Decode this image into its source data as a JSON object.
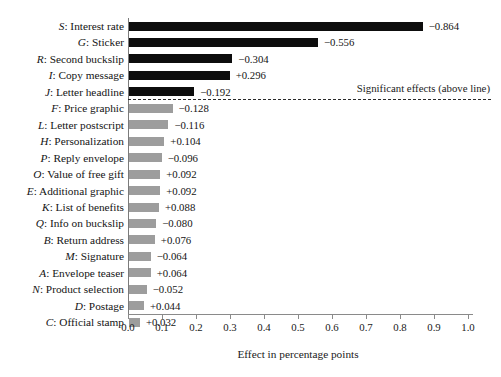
{
  "chart_data": {
    "type": "bar",
    "orientation": "horizontal",
    "title": "",
    "xlabel": "Effect in percentage points",
    "ylabel": "",
    "xlim": [
      0.0,
      1.0
    ],
    "xticks": [
      "0.0",
      "0.1",
      "0.2",
      "0.3",
      "0.4",
      "0.5",
      "0.6",
      "0.7",
      "0.8",
      "0.9",
      "1.0"
    ],
    "xtick_values": [
      0.0,
      0.1,
      0.2,
      0.3,
      0.4,
      0.5,
      0.6,
      0.7,
      0.8,
      0.9,
      1.0
    ],
    "grid": false,
    "legend": null,
    "annotations": [
      {
        "text": "Significant effects (above line)",
        "kind": "divider-note",
        "position": "right-of-dashed-line"
      }
    ],
    "divider": {
      "style": "dashed",
      "after_category_index": 4,
      "meaning": "bars above the line are statistically significant"
    },
    "categories": [
      "S: Interest rate",
      "G: Sticker",
      "R: Second buckslip",
      "I: Copy message",
      "J: Letter headline",
      "F: Price graphic",
      "L: Letter postscript",
      "H: Personalization",
      "P: Reply envelope",
      "O: Value of free gift",
      "E: Additional graphic",
      "K: List of benefits",
      "Q: Info on buckslip",
      "B: Return address",
      "M: Signature",
      "A: Envelope teaser",
      "N: Product selection",
      "D: Postage",
      "C: Official stamp"
    ],
    "values": [
      0.864,
      0.556,
      0.304,
      0.296,
      0.192,
      0.128,
      0.116,
      0.104,
      0.096,
      0.092,
      0.092,
      0.088,
      0.08,
      0.076,
      0.064,
      0.064,
      0.052,
      0.044,
      0.032
    ],
    "signs": [
      "-",
      "-",
      "-",
      "+",
      "-",
      "-",
      "-",
      "+",
      "-",
      "+",
      "+",
      "+",
      "-",
      "+",
      "-",
      "+",
      "-",
      "+",
      "+"
    ],
    "signed_values": [
      -0.864,
      -0.556,
      -0.304,
      0.296,
      -0.192,
      -0.128,
      -0.116,
      0.104,
      -0.096,
      0.092,
      0.092,
      0.088,
      -0.08,
      0.076,
      -0.064,
      0.064,
      -0.052,
      0.044,
      0.032
    ]
  },
  "rows": [
    {
      "code": "S",
      "name": "Interest rate",
      "label": "S: Interest rate",
      "value_label": "−0.864",
      "magnitude": 0.864,
      "significant": true
    },
    {
      "code": "G",
      "name": "Sticker",
      "label": "G: Sticker",
      "value_label": "−0.556",
      "magnitude": 0.556,
      "significant": true
    },
    {
      "code": "R",
      "name": "Second buckslip",
      "label": "R: Second buckslip",
      "value_label": "−0.304",
      "magnitude": 0.304,
      "significant": true
    },
    {
      "code": "I",
      "name": "Copy message",
      "label": "I: Copy message",
      "value_label": "+0.296",
      "magnitude": 0.296,
      "significant": true
    },
    {
      "code": "J",
      "name": "Letter headline",
      "label": "J: Letter headline",
      "value_label": "−0.192",
      "magnitude": 0.192,
      "significant": true
    },
    {
      "code": "F",
      "name": "Price graphic",
      "label": "F: Price graphic",
      "value_label": "−0.128",
      "magnitude": 0.128,
      "significant": false
    },
    {
      "code": "L",
      "name": "Letter postscript",
      "label": "L: Letter postscript",
      "value_label": "−0.116",
      "magnitude": 0.116,
      "significant": false
    },
    {
      "code": "H",
      "name": "Personalization",
      "label": "H: Personalization",
      "value_label": "+0.104",
      "magnitude": 0.104,
      "significant": false
    },
    {
      "code": "P",
      "name": "Reply envelope",
      "label": "P: Reply envelope",
      "value_label": "−0.096",
      "magnitude": 0.096,
      "significant": false
    },
    {
      "code": "O",
      "name": "Value of free gift",
      "label": "O: Value of free gift",
      "value_label": "+0.092",
      "magnitude": 0.092,
      "significant": false
    },
    {
      "code": "E",
      "name": "Additional graphic",
      "label": "E: Additional graphic",
      "value_label": "+0.092",
      "magnitude": 0.092,
      "significant": false
    },
    {
      "code": "K",
      "name": "List of benefits",
      "label": "K: List of benefits",
      "value_label": "+0.088",
      "magnitude": 0.088,
      "significant": false
    },
    {
      "code": "Q",
      "name": "Info on buckslip",
      "label": "Q: Info on buckslip",
      "value_label": "−0.080",
      "magnitude": 0.08,
      "significant": false
    },
    {
      "code": "B",
      "name": "Return address",
      "label": "B: Return address",
      "value_label": "+0.076",
      "magnitude": 0.076,
      "significant": false
    },
    {
      "code": "M",
      "name": "Signature",
      "label": "M: Signature",
      "value_label": "−0.064",
      "magnitude": 0.064,
      "significant": false
    },
    {
      "code": "A",
      "name": "Envelope teaser",
      "label": "A: Envelope teaser",
      "value_label": "+0.064",
      "magnitude": 0.064,
      "significant": false
    },
    {
      "code": "N",
      "name": "Product selection",
      "label": "N: Product selection",
      "value_label": "−0.052",
      "magnitude": 0.052,
      "significant": false
    },
    {
      "code": "D",
      "name": "Postage",
      "label": "D: Postage",
      "value_label": "+0.044",
      "magnitude": 0.044,
      "significant": false
    },
    {
      "code": "C",
      "name": "Official stamp",
      "label": "C: Official stamp",
      "value_label": "+0.032",
      "magnitude": 0.032,
      "significant": false
    }
  ],
  "axis": {
    "x_title": "Effect in percentage points",
    "x_ticks": [
      "0.0",
      "0.1",
      "0.2",
      "0.3",
      "0.4",
      "0.5",
      "0.6",
      "0.7",
      "0.8",
      "0.9",
      "1.0"
    ]
  },
  "divider_note": "Significant effects (above line)",
  "colors": {
    "significant_bar": "#0d0d0d",
    "nonsignificant_bar": "#9d9d9d",
    "axis": "#8a8a8a",
    "text": "#141414",
    "background": "#ffffff",
    "divider": "#2a2a2a"
  }
}
